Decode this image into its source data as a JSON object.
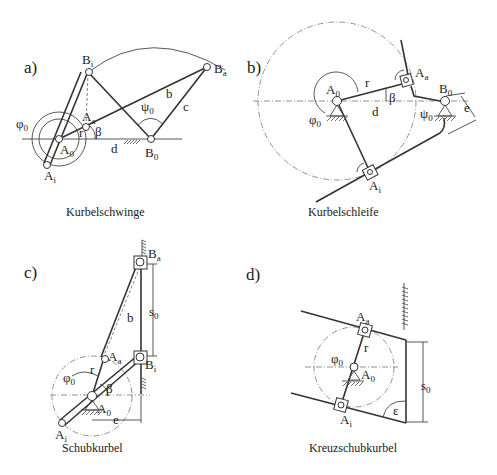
{
  "panels": {
    "a": {
      "label": "a)",
      "caption": "Kurbelschwinge",
      "points": {
        "A0": "A",
        "A0_sub": "0",
        "Aa": "A",
        "Aa_sub": "a",
        "Ai": "A",
        "Ai_sub": "i",
        "B0": "B",
        "B0_sub": "0",
        "Ba": "B",
        "Ba_sub": "a",
        "Bi": "B",
        "Bi_sub": "i"
      },
      "symbols": {
        "phi0": "φ",
        "phi0_sub": "0",
        "psi0": "ψ",
        "psi0_sub": "0",
        "beta": "β",
        "r": "r",
        "b": "b",
        "c": "c",
        "d": "d"
      }
    },
    "b": {
      "label": "b)",
      "caption": "Kurbelschleife",
      "points": {
        "A0": "A",
        "A0_sub": "0",
        "Aa": "A",
        "Aa_sub": "a",
        "Ai": "A",
        "Ai_sub": "i",
        "B0": "B",
        "B0_sub": "0"
      },
      "symbols": {
        "phi0": "φ",
        "phi0_sub": "0",
        "psi0": "ψ",
        "psi0_sub": "0",
        "beta": "β",
        "r": "r",
        "d": "d",
        "e": "e"
      }
    },
    "c": {
      "label": "c)",
      "caption": "Schubkurbel",
      "points": {
        "A0": "A",
        "A0_sub": "0",
        "Aa": "A",
        "Aa_sub": "a",
        "Ai": "A",
        "Ai_sub": "i",
        "Ba": "B",
        "Ba_sub": "a",
        "Bi": "B",
        "Bi_sub": "i"
      },
      "symbols": {
        "phi0": "φ",
        "phi0_sub": "0",
        "beta": "β",
        "r": "r",
        "b": "b",
        "s0": "s",
        "s0_sub": "0",
        "e": "e"
      }
    },
    "d": {
      "label": "d)",
      "caption": "Kreuzschubkurbel",
      "points": {
        "A0": "A",
        "A0_sub": "0",
        "Aa": "A",
        "Aa_sub": "a",
        "Ai": "A",
        "Ai_sub": "i"
      },
      "symbols": {
        "phi0": "φ",
        "phi0_sub": "0",
        "r": "r",
        "s0": "s",
        "s0_sub": "0",
        "epsilon": "ε"
      }
    }
  }
}
